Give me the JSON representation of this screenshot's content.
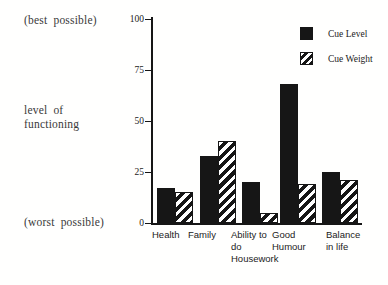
{
  "side_labels": {
    "best": "(best possible)",
    "axis_title_lines": [
      "level of",
      "functioning"
    ],
    "worst": "(worst possible)"
  },
  "legend": {
    "items": [
      {
        "label": "Cue Level",
        "swatch": "solid"
      },
      {
        "label": "Cue Weight",
        "swatch": "hatched"
      }
    ]
  },
  "chart_data": {
    "type": "bar",
    "title": "",
    "categories": [
      "Health",
      "Family",
      "Ability to do Housework",
      "Good Humour",
      "Balance in life"
    ],
    "category_label_lines": [
      [
        "Health"
      ],
      [
        "Family"
      ],
      [
        "Ability to",
        "do",
        "Housework"
      ],
      [
        "Good",
        "Humour"
      ],
      [
        "Balance",
        "in life"
      ]
    ],
    "series": [
      {
        "name": "Cue Level",
        "pattern": "solid",
        "values": [
          17,
          33,
          20,
          68,
          25
        ]
      },
      {
        "name": "Cue Weight",
        "pattern": "hatched",
        "values": [
          15,
          40,
          5,
          19,
          21
        ]
      }
    ],
    "ylabel": "level of functioning",
    "ylim": [
      0,
      100
    ],
    "yticks": [
      0,
      25,
      50,
      75,
      100
    ],
    "grid": false,
    "legend_position": "top-right",
    "colors": {
      "bar_solid": "#161616",
      "axis": "#161616",
      "text": "#2e2e2e"
    }
  }
}
